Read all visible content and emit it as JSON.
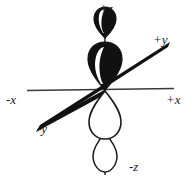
{
  "figure": {
    "background_color": "#ffffff",
    "stroke_color": "#1a1a1a",
    "fill_color": "#111111",
    "width": 195,
    "height": 184
  },
  "axes": {
    "labels": {
      "plus_z": "+z",
      "minus_z": "-z",
      "plus_y": "+y",
      "minus_y": "-y",
      "plus_x": "+x",
      "minus_x": "-x"
    },
    "x_axis": {
      "name": "x-axis",
      "orientation": "horizontal",
      "style": "thin-line",
      "from": [
        27,
        90
      ],
      "to": [
        174,
        88
      ]
    },
    "y_axis": {
      "name": "y-axis",
      "orientation": "diagonal-lower-left-to-upper-right",
      "style": "thick-tapered-line",
      "from": [
        36,
        130
      ],
      "to": [
        170,
        42
      ]
    },
    "z_axis": {
      "name": "z-axis",
      "orientation": "vertical",
      "style": "thin-line",
      "from": [
        105,
        17
      ],
      "to": [
        105,
        175
      ]
    }
  },
  "orbital": {
    "type": "f-orbital (z-axis lobes)",
    "lobes": [
      {
        "name": "outer-upper-lobe",
        "position": "upper-outer",
        "fill": "filled-black",
        "shape": "teardrop-pointing-down",
        "phase": "+"
      },
      {
        "name": "inner-upper-lobe",
        "position": "upper-inner",
        "fill": "filled-black",
        "shape": "teardrop-pointing-down",
        "phase": "+"
      },
      {
        "name": "inner-lower-lobe",
        "position": "lower-inner",
        "fill": "outline-white",
        "shape": "teardrop-pointing-up",
        "phase": "-"
      },
      {
        "name": "outer-lower-lobe",
        "position": "lower-outer",
        "fill": "outline-white",
        "shape": "teardrop-pointing-up",
        "phase": "-"
      }
    ]
  }
}
